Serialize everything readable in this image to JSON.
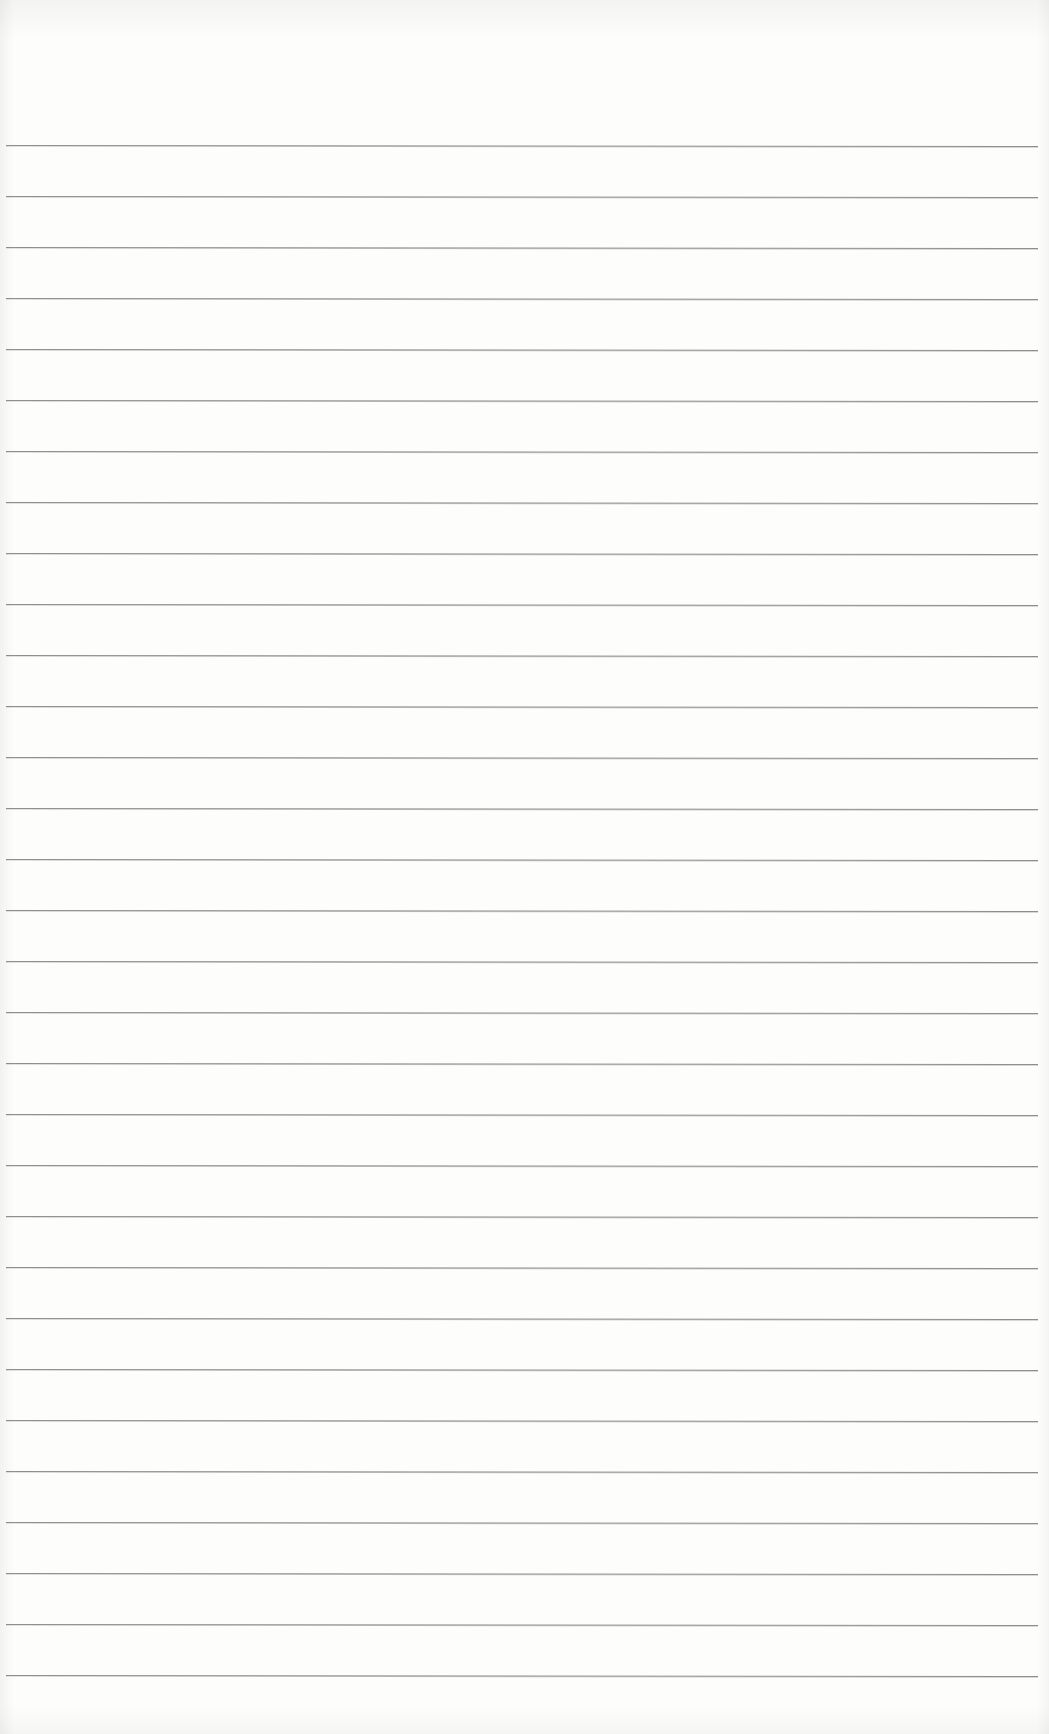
{
  "page": {
    "type": "blank lined paper",
    "background_color": "#fdfdfc",
    "line_color": "#8f8f8f",
    "line_count": 31,
    "first_line_y": 145,
    "line_spacing": 51,
    "line_x_start": 6,
    "line_x_end": 1038
  }
}
